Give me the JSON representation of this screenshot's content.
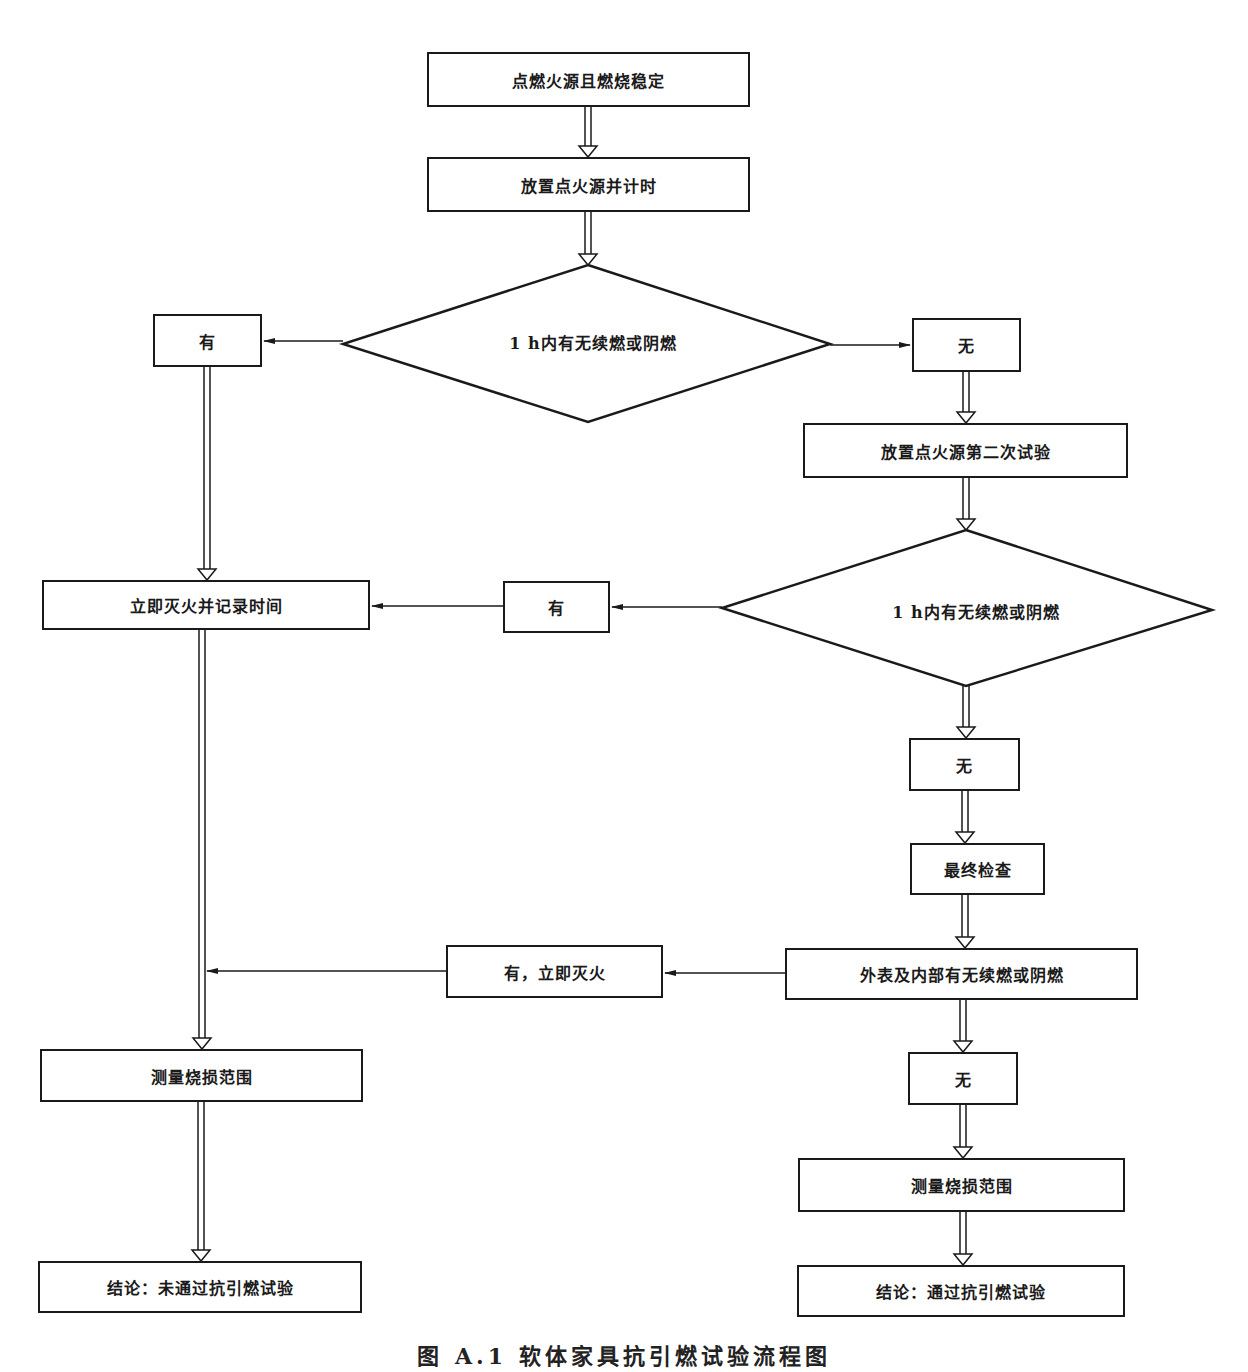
{
  "flowchart": {
    "nodes": {
      "start": "点燃火源且燃烧稳定",
      "place_timer": "放置点火源并计时",
      "decision1": "1 h内有无续燃或阴燃",
      "yes1": "有",
      "no1": "无",
      "second_test": "放置点火源第二次试验",
      "extinguish_record": "立即灭火并记录时间",
      "decision2": "1 h内有无续燃或阴燃",
      "yes2": "有",
      "no2": "无",
      "final_check": "最终检查",
      "surface_interior_check": "外表及内部有无续燃或阴燃",
      "yes3": "有，立即灭火",
      "no3": "无",
      "measure_left": "测量烧损范围",
      "measure_right": "测量烧损范围",
      "conclusion_fail": "结论：未通过抗引燃试验",
      "conclusion_pass": "结论：通过抗引燃试验"
    },
    "edges": [
      {
        "from": "start",
        "to": "place_timer",
        "style": "hollow-double"
      },
      {
        "from": "place_timer",
        "to": "decision1",
        "style": "hollow-double"
      },
      {
        "from": "decision1",
        "to": "yes1",
        "style": "single"
      },
      {
        "from": "decision1",
        "to": "no1",
        "style": "single"
      },
      {
        "from": "no1",
        "to": "second_test",
        "style": "hollow-double"
      },
      {
        "from": "yes1",
        "to": "extinguish_record",
        "style": "hollow-double"
      },
      {
        "from": "second_test",
        "to": "decision2",
        "style": "hollow-double"
      },
      {
        "from": "decision2",
        "to": "yes2",
        "style": "single"
      },
      {
        "from": "yes2",
        "to": "extinguish_record",
        "style": "single"
      },
      {
        "from": "decision2",
        "to": "no2",
        "style": "hollow-double"
      },
      {
        "from": "no2",
        "to": "final_check",
        "style": "hollow-double"
      },
      {
        "from": "final_check",
        "to": "surface_interior_check",
        "style": "hollow-double"
      },
      {
        "from": "surface_interior_check",
        "to": "yes3",
        "style": "single"
      },
      {
        "from": "yes3",
        "to": "left-column",
        "style": "single"
      },
      {
        "from": "extinguish_record",
        "to": "measure_left",
        "style": "hollow-double"
      },
      {
        "from": "surface_interior_check",
        "to": "no3",
        "style": "hollow-double"
      },
      {
        "from": "no3",
        "to": "measure_right",
        "style": "hollow-double"
      },
      {
        "from": "measure_left",
        "to": "conclusion_fail",
        "style": "hollow-double"
      },
      {
        "from": "measure_right",
        "to": "conclusion_pass",
        "style": "hollow-double"
      }
    ],
    "colors": {
      "line": "#1a1a1a",
      "background": "#ffffff"
    }
  },
  "caption": "图 A.1  软体家具抗引燃试验流程图"
}
